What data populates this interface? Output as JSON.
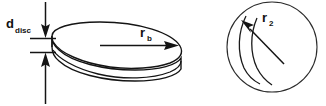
{
  "figure": {
    "title": "",
    "background_color": "#ffffff",
    "line_color": "#141414",
    "width": 326,
    "height": 106
  },
  "labels": {
    "disc_thickness": {
      "base": "d",
      "subscript": "disc",
      "full": "d_disc"
    },
    "disc_radius": {
      "base": "r",
      "subscript": "b",
      "full": "r_b"
    },
    "impeller_radius": {
      "base": "r",
      "subscript": "2",
      "full": "r_2"
    }
  },
  "left_view": {
    "name": "disc-perspective-view",
    "description": "Flat cylindrical disc drawn in oblique perspective",
    "dimension_line": {
      "name": "thickness-dimension",
      "arrow_top_y": 0,
      "arrow_bottom_y": 106,
      "x": 45,
      "extension_upper_y": 38,
      "extension_lower_y": 52
    },
    "radius_arrow": {
      "name": "radius-arrow",
      "start_x": 100,
      "start_y": 45,
      "end_x": 172,
      "end_y": 45
    }
  },
  "right_view": {
    "name": "impeller-plan-view",
    "description": "Circular plan view of impeller with two curved blades",
    "circle": {
      "center_x": 272,
      "center_y": 47,
      "radius": 45
    },
    "radius_arrow": {
      "name": "r2-radius-arrow",
      "start_x": 281,
      "start_y": 62,
      "end_x": 243,
      "end_y": 23
    },
    "blade_count": 2
  }
}
